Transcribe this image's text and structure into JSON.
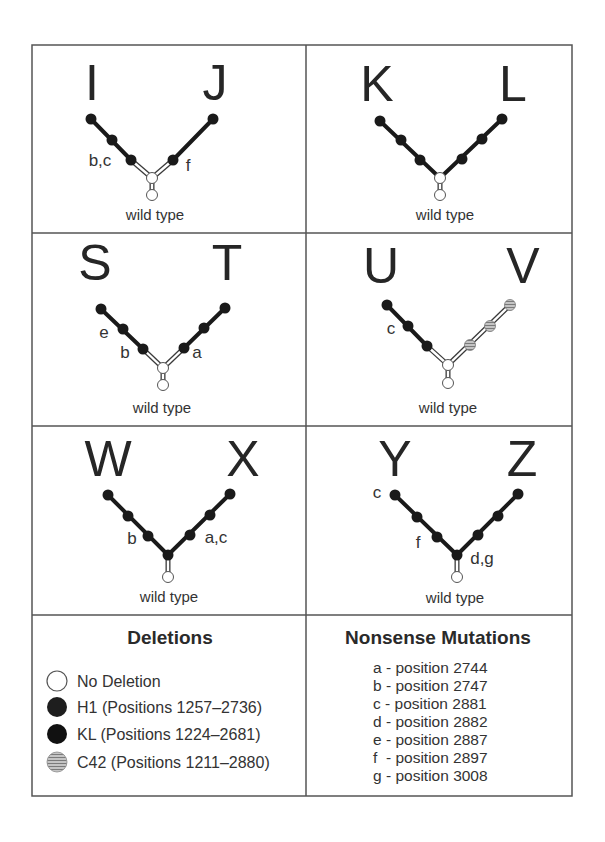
{
  "figure": {
    "panels": [
      {
        "id": "IJ",
        "left_label": "I",
        "right_label": "J",
        "center_label": "wild type",
        "left_mutations": "b,c",
        "right_mutations": "f"
      },
      {
        "id": "KL",
        "left_label": "K",
        "right_label": "L",
        "center_label": "wild type"
      },
      {
        "id": "ST",
        "left_label": "S",
        "right_label": "T",
        "center_label": "wild type",
        "left_mutations_outer": "e",
        "left_mutations_inner": "b",
        "right_mutations": "a"
      },
      {
        "id": "UV",
        "left_label": "U",
        "right_label": "V",
        "center_label": "wild type",
        "left_mutations": "c"
      },
      {
        "id": "WX",
        "left_label": "W",
        "right_label": "X",
        "center_label": "wild type",
        "left_mutations": "b",
        "right_mutations": "a,c"
      },
      {
        "id": "YZ",
        "left_label": "Y",
        "right_label": "Z",
        "center_label": "wild type",
        "left_mutations_outer": "c",
        "left_mutations_inner": "f",
        "center_mutations": "d,g"
      }
    ],
    "deletions": {
      "title": "Deletions",
      "items": [
        {
          "key": "none",
          "label": "No Deletion",
          "color": "#ffffff"
        },
        {
          "key": "H1",
          "label": "H1 (Positions 1257–2736)",
          "color": "#1e1e1e"
        },
        {
          "key": "KL",
          "label": "KL (Positions 1224–2681)",
          "color": "#111111"
        },
        {
          "key": "C42",
          "label": "C42 (Positions 1211–2880)",
          "color": "#a8a8a8"
        }
      ]
    },
    "nonsense_mutations": {
      "title": "Nonsense Mutations",
      "items": [
        {
          "letter": "a",
          "text": "a - position 2744"
        },
        {
          "letter": "b",
          "text": "b - position 2747"
        },
        {
          "letter": "c",
          "text": "c - position 2881"
        },
        {
          "letter": "d",
          "text": "d - position 2882"
        },
        {
          "letter": "e",
          "text": "e - position 2887"
        },
        {
          "letter": "f",
          "text": "f  - position 2897"
        },
        {
          "letter": "g",
          "text": "g - position 3008"
        }
      ]
    },
    "colors": {
      "frame": "#555555",
      "node_black": "#1a1a1a",
      "node_white": "#ffffff",
      "node_hatched": "#a8a8a8"
    }
  }
}
